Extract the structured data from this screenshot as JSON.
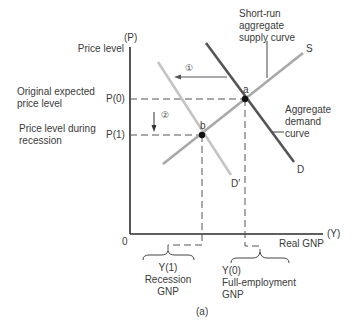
{
  "figure": {
    "caption": "(a)",
    "axes": {
      "y_symbol": "(P)",
      "y_label": "Price level",
      "x_symbol": "(Y)",
      "x_label": "Real GNP",
      "origin": "0"
    },
    "price_levels": [
      {
        "tick": "P(0)",
        "description_line1": "Original expected",
        "description_line2": "price level"
      },
      {
        "tick": "P(1)",
        "description_line1": "Price level during",
        "description_line2": "recession"
      }
    ],
    "output_levels": [
      {
        "tick": "Y(1)",
        "description_line1": "Recession",
        "description_line2": "GNP"
      },
      {
        "tick": "Y(0)",
        "description_line1": "Full-employment",
        "description_line2": "GNP"
      }
    ],
    "curves": {
      "supply": {
        "label": "S",
        "callout_line1": "Short-run",
        "callout_line2": "aggregate",
        "callout_line3": "supply curve",
        "color": "#a8a8a8"
      },
      "demand": {
        "label": "D",
        "callout_line1": "Aggregate",
        "callout_line2": "demand",
        "callout_line3": "curve",
        "color": "#555555"
      },
      "demand_shifted": {
        "label": "D′",
        "color": "#c4c4c4"
      }
    },
    "points": [
      {
        "label": "a",
        "x": "Y(0)",
        "y": "P(0)"
      },
      {
        "label": "b",
        "x": "Y(1)",
        "y": "P(1)"
      }
    ],
    "steps": [
      {
        "marker": "①",
        "meaning": "demand shifts left"
      },
      {
        "marker": "②",
        "meaning": "price level falls"
      }
    ]
  }
}
